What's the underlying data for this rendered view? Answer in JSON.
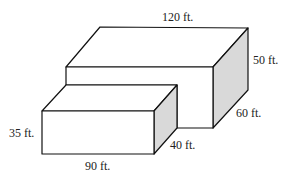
{
  "diagram": {
    "type": "3d-boxes",
    "colors": {
      "stroke": "#111111",
      "face": "#ffffff",
      "side": "#d9d9d9"
    },
    "large_box": {
      "length": "120 ft.",
      "height": "50 ft.",
      "depth": "60 ft."
    },
    "small_box": {
      "length": "90 ft.",
      "height": "35 ft.",
      "depth": "40 ft."
    }
  }
}
